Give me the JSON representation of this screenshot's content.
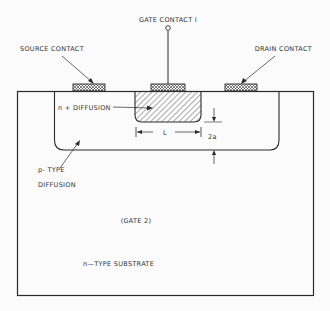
{
  "diagram": {
    "type": "semiconductor cross-section",
    "labels": {
      "gate_contact_1": "GATE CONTACT I",
      "source_contact": "SOURCE CONTACT",
      "drain_contact": "DRAIN CONTACT",
      "n_plus_diffusion": "n + DIFFUSION",
      "channel_length": "L",
      "depth": "2a",
      "p_type_line1": "p- TYPE",
      "p_type_line2": "DIFFUSION",
      "gate_2": "(GATE 2)",
      "substrate": "n—TYPE SUBSTRATE"
    },
    "colors": {
      "line": "#2a2a2a",
      "background": "#fbfbfb"
    }
  }
}
